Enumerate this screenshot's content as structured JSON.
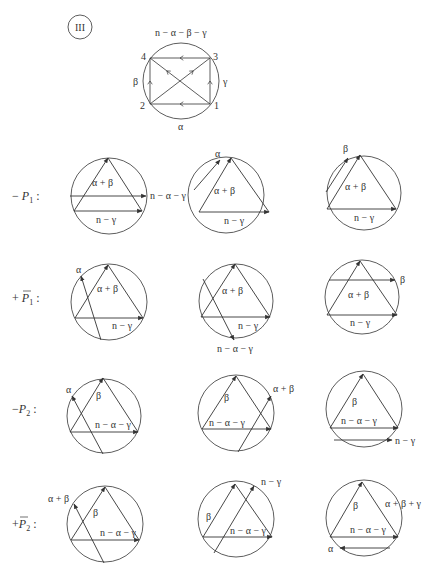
{
  "header": {
    "case_label": "III",
    "case_circle": {
      "cx": 80,
      "cy": 27,
      "r": 12
    }
  },
  "top_diagram": {
    "circle": {
      "cx": 181,
      "cy": 81,
      "r": 38
    },
    "vertices": [
      {
        "id": "1",
        "x": 210,
        "y": 104,
        "lx": 214,
        "ly": 109
      },
      {
        "id": "2",
        "x": 150,
        "y": 104,
        "lx": 140,
        "ly": 109
      },
      {
        "id": "3",
        "x": 210,
        "y": 58,
        "lx": 213,
        "ly": 60
      },
      {
        "id": "4",
        "x": 150,
        "y": 58,
        "lx": 141,
        "ly": 60
      }
    ],
    "edges": [
      {
        "from": "3",
        "to": "4",
        "mid_arrow": "left"
      },
      {
        "from": "1",
        "to": "2",
        "mid_arrow": "left"
      },
      {
        "from": "2",
        "to": "4",
        "mid_arrow": "up"
      },
      {
        "from": "1",
        "to": "3",
        "mid_arrow": "up"
      },
      {
        "from": "2",
        "to": "3",
        "mid_arrow": "diag"
      },
      {
        "from": "1",
        "to": "4",
        "mid_arrow": "diag"
      }
    ],
    "arc_labels": [
      {
        "text": "n − α − β − γ",
        "x": 155,
        "y": 36
      },
      {
        "text": "β",
        "x": 133,
        "y": 85
      },
      {
        "text": "γ",
        "x": 223,
        "y": 85
      },
      {
        "text": "α",
        "x": 178,
        "y": 130
      }
    ]
  },
  "rows": [
    {
      "label_sign": "− ",
      "label_var": "P",
      "label_sub": "1",
      "label_bar": false,
      "label_y": 200,
      "diagrams": [
        {
          "cx": 109,
          "cy": 196,
          "r": 38,
          "apex": [
            108,
            158
          ],
          "bl": [
            74,
            211
          ],
          "br": [
            142,
            211
          ],
          "side_label": "α + β",
          "side_pos": [
            92,
            186
          ],
          "base_label": "n − γ",
          "base_pos": [
            96,
            223
          ],
          "extra": {
            "x1": 70,
            "y1": 196,
            "x2": 146,
            "y2": 196,
            "arrow_end": true,
            "label": "n − α − γ",
            "lx": 150,
            "ly": 199
          }
        },
        {
          "cx": 226,
          "cy": 195,
          "r": 38,
          "apex": [
            231,
            158
          ],
          "bl": [
            199,
            212
          ],
          "br": [
            269,
            212
          ],
          "side_label": "α + β",
          "side_pos": [
            214,
            194
          ],
          "base_label": "n − γ",
          "base_pos": [
            224,
            224
          ],
          "extra": {
            "x1": 194,
            "y1": 190,
            "x2": 220,
            "y2": 160,
            "arrow_end": true,
            "label": "α",
            "lx": 215,
            "ly": 157
          }
        },
        {
          "cx": 364,
          "cy": 193,
          "r": 37,
          "apex": [
            360,
            155
          ],
          "bl": [
            327,
            209
          ],
          "br": [
            396,
            209
          ],
          "side_label": "α + β",
          "side_pos": [
            345,
            190
          ],
          "base_label": "n − γ",
          "base_pos": [
            354,
            221
          ],
          "extra": {
            "x1": 326,
            "y1": 192,
            "x2": 348,
            "y2": 158,
            "arrow_end": true,
            "label": "β",
            "lx": 343,
            "ly": 152
          }
        }
      ]
    },
    {
      "label_sign": "+ ",
      "label_var": "P",
      "label_sub": "1",
      "label_bar": true,
      "label_y": 302,
      "diagrams": [
        {
          "cx": 109,
          "cy": 302,
          "r": 38,
          "apex": [
            108,
            265
          ],
          "bl": [
            75,
            318
          ],
          "br": [
            143,
            318
          ],
          "side_label": "α + β",
          "side_pos": [
            97,
            292
          ],
          "base_label": "n − γ",
          "base_pos": [
            112,
            329
          ],
          "extra": {
            "x1": 101,
            "y1": 340,
            "x2": 81,
            "y2": 276,
            "arrow_end": true,
            "label": "α",
            "lx": 76,
            "ly": 273
          }
        },
        {
          "cx": 236,
          "cy": 301,
          "r": 37,
          "apex": [
            235,
            264
          ],
          "bl": [
            201,
            317
          ],
          "br": [
            270,
            317
          ],
          "side_label": "α + β",
          "side_pos": [
            222,
            294
          ],
          "base_label": "n − γ",
          "base_pos": [
            238,
            329
          ],
          "extra": {
            "x1": 203,
            "y1": 279,
            "x2": 234,
            "y2": 340,
            "arrow_end": true,
            "label": "n − α − γ",
            "lx": 217,
            "ly": 352
          }
        },
        {
          "cx": 362,
          "cy": 297,
          "r": 37,
          "apex": [
            360,
            261
          ],
          "bl": [
            327,
            315
          ],
          "br": [
            397,
            315
          ],
          "side_label": "α + β",
          "side_pos": [
            348,
            298
          ],
          "base_label": "n − γ",
          "base_pos": [
            350,
            326
          ],
          "extra": {
            "x1": 329,
            "y1": 280,
            "x2": 395,
            "y2": 280,
            "arrow_end": true,
            "label": "β",
            "lx": 400,
            "ly": 283
          }
        }
      ]
    },
    {
      "label_sign": "−",
      "label_var": "P",
      "label_sub": "2",
      "label_bar": false,
      "label_y": 413,
      "diagrams": [
        {
          "cx": 104,
          "cy": 416,
          "r": 37,
          "apex": [
            103,
            378
          ],
          "bl": [
            70,
            432
          ],
          "br": [
            138,
            432
          ],
          "side_label": "β",
          "side_pos": [
            96,
            399
          ],
          "base_label": "n − α − γ",
          "base_pos": [
            95,
            428
          ],
          "extra": {
            "x1": 103,
            "y1": 454,
            "x2": 72,
            "y2": 396,
            "arrow_end": true,
            "label": "α",
            "lx": 66,
            "ly": 393
          }
        },
        {
          "cx": 236,
          "cy": 413,
          "r": 38,
          "apex": [
            236,
            376
          ],
          "bl": [
            202,
            429
          ],
          "br": [
            271,
            429
          ],
          "side_label": "β",
          "side_pos": [
            224,
            401
          ],
          "base_label": "n − α − γ",
          "base_pos": [
            209,
            426
          ],
          "extra": {
            "x1": 238,
            "y1": 452,
            "x2": 271,
            "y2": 396,
            "arrow_end": true,
            "label": "α + β",
            "lx": 273,
            "ly": 392
          }
        },
        {
          "cx": 364,
          "cy": 409,
          "r": 38,
          "apex": [
            363,
            374
          ],
          "bl": [
            330,
            428
          ],
          "br": [
            398,
            428
          ],
          "side_label": "β",
          "side_pos": [
            352,
            405
          ],
          "base_label": "n − α − γ",
          "base_pos": [
            341,
            424
          ],
          "extra": {
            "x1": 334,
            "y1": 440,
            "x2": 392,
            "y2": 440,
            "arrow_end": true,
            "label": "n − γ",
            "lx": 395,
            "ly": 444
          }
        }
      ]
    },
    {
      "label_sign": "+",
      "label_var": "P",
      "label_sub": "2",
      "label_bar": true,
      "label_y": 528,
      "diagrams": [
        {
          "cx": 105,
          "cy": 524,
          "r": 38,
          "apex": [
            105,
            487
          ],
          "bl": [
            71,
            540
          ],
          "br": [
            139,
            540
          ],
          "side_label": "β",
          "side_pos": [
            93,
            516
          ],
          "base_label": "n − α − γ",
          "base_pos": [
            100,
            536
          ],
          "extra": {
            "x1": 104,
            "y1": 563,
            "x2": 74,
            "y2": 504,
            "arrow_end": true,
            "label": "α + β",
            "lx": 48,
            "ly": 502
          }
        },
        {
          "cx": 236,
          "cy": 519,
          "r": 38,
          "apex": [
            235,
            484
          ],
          "bl": [
            203,
            537
          ],
          "br": [
            272,
            537
          ],
          "side_label": "β",
          "side_pos": [
            206,
            520
          ],
          "base_label": "n − α − γ",
          "base_pos": [
            230,
            534
          ],
          "extra": {
            "x1": 214,
            "y1": 553,
            "x2": 254,
            "y2": 486,
            "arrow_end": true,
            "label": "n − γ",
            "lx": 261,
            "ly": 485
          }
        },
        {
          "cx": 364,
          "cy": 518,
          "r": 38,
          "apex": [
            362,
            482
          ],
          "bl": [
            330,
            537
          ],
          "br": [
            398,
            537
          ],
          "side_label": "β",
          "side_pos": [
            353,
            509
          ],
          "base_label": "n − α − γ",
          "base_pos": [
            350,
            533
          ],
          "extra": {
            "x1": 390,
            "y1": 548,
            "x2": 340,
            "y2": 548,
            "arrow_end": true,
            "label": "α",
            "lx": 328,
            "ly": 552,
            "label_anchor": "start"
          }
        },
        {
          "_note": "label for third diagram upper right",
          "cx": 0,
          "cy": 0,
          "r": 0,
          "hidden": true,
          "side_label": "α + β + γ",
          "side_pos": [
            385,
            507
          ]
        }
      ]
    }
  ],
  "style": {
    "stroke": "#333333",
    "stroke_light": "#555555",
    "background": "#ffffff"
  }
}
